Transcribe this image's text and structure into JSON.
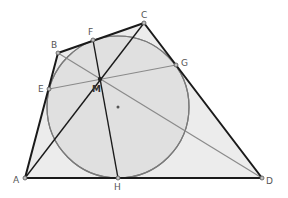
{
  "diagram": {
    "type": "geometry",
    "colors": {
      "background": "#ffffff",
      "fill": "#e8e8e8",
      "circle_fill": "#dedede",
      "edge": "#1a1a1a",
      "circle_stroke": "#7a7a7a",
      "chord": "#888888",
      "label": "#555555"
    },
    "points": {
      "A": {
        "label": "A",
        "x": 25,
        "y": 178
      },
      "B": {
        "label": "B",
        "x": 58,
        "y": 53
      },
      "C": {
        "label": "C",
        "x": 144,
        "y": 23
      },
      "D": {
        "label": "D",
        "x": 262,
        "y": 178
      },
      "E": {
        "label": "E",
        "x": 49,
        "y": 89
      },
      "F": {
        "label": "F",
        "x": 93,
        "y": 40
      },
      "G": {
        "label": "G",
        "x": 176,
        "y": 65
      },
      "H": {
        "label": "H",
        "x": 118,
        "y": 178
      },
      "M": {
        "label": "M",
        "x": 100,
        "y": 79
      },
      "O": {
        "label": "",
        "x": 118,
        "y": 107
      }
    },
    "circle": {
      "cx": 118,
      "cy": 107,
      "r": 71
    },
    "quadrilateral": [
      "A",
      "B",
      "C",
      "D"
    ],
    "segments_dark": [
      [
        "A",
        "C"
      ],
      [
        "F",
        "H"
      ]
    ],
    "segments_gray": [
      [
        "B",
        "D"
      ],
      [
        "E",
        "G"
      ]
    ]
  }
}
